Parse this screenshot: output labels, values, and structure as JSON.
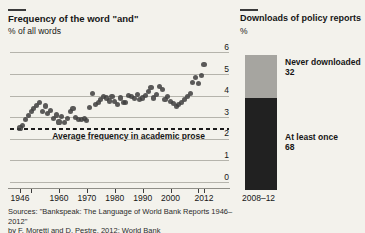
{
  "colors": {
    "background": "#f3f2ec",
    "grid": "#b5b4ac",
    "dot": "#3e3e3e",
    "reference_line": "#1c1c1c",
    "bar_never": "#a6a5a0",
    "bar_once": "#212121",
    "text": "#161616"
  },
  "left_chart": {
    "title": "Frequency of the word \"and\"",
    "subtitle": "% of all words",
    "annotation": "Average frequency in academic prose",
    "sources_line1": "Sources: \"Bankspeak: The Language of World Bank Reports 1946–2012\"",
    "sources_line2": "by F. Moretti and D. Pestre, 2012; World Bank"
  },
  "right_chart": {
    "title": "Downloads of policy reports",
    "subtitle": "%",
    "x_label": "2008–12"
  },
  "chart_data": [
    {
      "type": "scatter",
      "title": "Frequency of the word \"and\"",
      "ylabel": "% of all words",
      "xlim": [
        1946,
        2012
      ],
      "ylim": [
        0,
        6
      ],
      "grid": true,
      "y_ticks": [
        0,
        1,
        2,
        3,
        4,
        5,
        6
      ],
      "x_tick_marks": [
        1946,
        1950,
        1960,
        1970,
        1980,
        1990,
        2000,
        2010,
        2012
      ],
      "x_tick_labels": [
        1946,
        1960,
        1970,
        1980,
        1990,
        2000,
        2012
      ],
      "reference_line": {
        "value": 2.45,
        "label": "Average frequency in academic prose",
        "style": "dashed"
      },
      "x": [
        1946,
        1947,
        1948,
        1949,
        1950,
        1951,
        1952,
        1953,
        1954,
        1955,
        1956,
        1957,
        1958,
        1959,
        1960,
        1961,
        1962,
        1963,
        1964,
        1965,
        1966,
        1967,
        1968,
        1969,
        1970,
        1971,
        1972,
        1973,
        1974,
        1975,
        1976,
        1977,
        1978,
        1979,
        1980,
        1981,
        1982,
        1983,
        1984,
        1985,
        1986,
        1987,
        1988,
        1989,
        1990,
        1991,
        1992,
        1993,
        1994,
        1995,
        1996,
        1997,
        1998,
        1999,
        2000,
        2001,
        2002,
        2003,
        2004,
        2005,
        2006,
        2007,
        2008,
        2009,
        2010,
        2011,
        2012
      ],
      "y": [
        2.5,
        2.62,
        2.9,
        3.08,
        3.25,
        3.42,
        3.55,
        3.68,
        3.25,
        3.52,
        3.18,
        3.3,
        2.95,
        3.1,
        2.78,
        3.05,
        2.75,
        2.95,
        3.25,
        3.42,
        3.0,
        2.88,
        2.9,
        2.96,
        2.86,
        3.43,
        4.1,
        3.6,
        3.66,
        3.81,
        3.95,
        3.89,
        3.75,
        3.97,
        3.74,
        3.6,
        3.89,
        3.7,
        3.66,
        4.0,
        3.97,
        3.85,
        4.04,
        3.81,
        3.89,
        4.0,
        4.2,
        4.36,
        3.89,
        4.05,
        4.44,
        4.28,
        3.81,
        3.97,
        3.73,
        3.65,
        3.49,
        3.6,
        3.7,
        3.81,
        3.95,
        4.1,
        4.6,
        4.85,
        4.55,
        4.95,
        5.45
      ]
    },
    {
      "type": "bar",
      "subtype": "stacked",
      "title": "Downloads of policy reports",
      "ylabel": "%",
      "categories": [
        "2008–12"
      ],
      "total": 100,
      "series": [
        {
          "name": "Never downloaded",
          "value": 32,
          "color": "#a6a5a0"
        },
        {
          "name": "At least once",
          "value": 68,
          "color": "#212121"
        }
      ]
    }
  ]
}
